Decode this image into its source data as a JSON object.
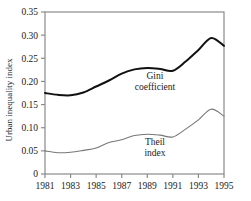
{
  "chart_data": {
    "type": "line",
    "title": "",
    "xlabel": "",
    "ylabel": "Urban inequality index",
    "xlim": [
      1981,
      1995
    ],
    "ylim": [
      0,
      0.35
    ],
    "grid": false,
    "legend_position": "inline-annotations",
    "x": [
      1981,
      1982,
      1983,
      1984,
      1985,
      1986,
      1987,
      1988,
      1989,
      1990,
      1991,
      1992,
      1993,
      1994,
      1995
    ],
    "xticks": [
      1981,
      1983,
      1985,
      1987,
      1989,
      1991,
      1993,
      1995
    ],
    "xticklabels": [
      "1981",
      "1983",
      "1985",
      "1987",
      "1989",
      "1991",
      "1993",
      "1995"
    ],
    "yticks": [
      0,
      0.05,
      0.1,
      0.15,
      0.2,
      0.25,
      0.3,
      0.35
    ],
    "yticklabels": [
      "0",
      "0.05",
      "0.10",
      "0.15",
      "0.20",
      "0.25",
      "0.30",
      "0.35"
    ],
    "series": [
      {
        "name": "Gini coefficient",
        "color": "#111111",
        "linewidth": 2.0,
        "values": [
          0.175,
          0.171,
          0.17,
          0.176,
          0.189,
          0.202,
          0.217,
          0.226,
          0.229,
          0.227,
          0.223,
          0.243,
          0.268,
          0.294,
          0.277
        ]
      },
      {
        "name": "Theil index",
        "color": "#777777",
        "linewidth": 1.1,
        "values": [
          0.05,
          0.046,
          0.047,
          0.051,
          0.056,
          0.068,
          0.074,
          0.083,
          0.086,
          0.084,
          0.08,
          0.097,
          0.117,
          0.14,
          0.125
        ]
      }
    ],
    "annotations": [
      {
        "id": "gini",
        "lines": [
          "Gini",
          "coefficient"
        ],
        "x": 1989.6,
        "y": 0.205
      },
      {
        "id": "theil",
        "lines": [
          "Theil",
          "index"
        ],
        "x": 1989.6,
        "y": 0.063
      }
    ]
  }
}
